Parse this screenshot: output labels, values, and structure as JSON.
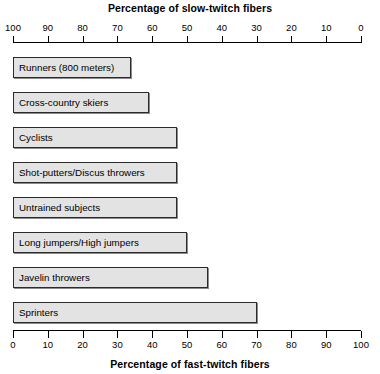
{
  "chart_data": {
    "type": "bar",
    "orientation": "horizontal",
    "title": "",
    "top_axis_title": "Percentage of slow-twitch fibers",
    "bottom_axis_title": "Percentage of fast-twitch fibers",
    "xlabel": "Percentage of fast-twitch fibers",
    "ylabel": "",
    "xlim": [
      0,
      100
    ],
    "grid": false,
    "legend": null,
    "bottom_ticks": [
      "0",
      "10",
      "20",
      "30",
      "40",
      "50",
      "60",
      "70",
      "80",
      "90",
      "100"
    ],
    "top_ticks": [
      "100",
      "90",
      "80",
      "70",
      "60",
      "50",
      "40",
      "30",
      "20",
      "10",
      "0"
    ],
    "bar_fill_color": "#e3e3e3",
    "bar_border_color": "#2b2b2b",
    "categories": [
      "Runners (800 meters)",
      "Cross-country skiers",
      "Cyclists",
      "Shot-putters/Discus throwers",
      "Untrained subjects",
      "Long jumpers/High jumpers",
      "Javelin throwers",
      "Sprinters"
    ],
    "values": [
      34,
      39,
      47,
      47,
      47,
      50,
      56,
      70
    ],
    "series": [
      {
        "name": "Percentage of fast-twitch fibers",
        "values": [
          34,
          39,
          47,
          47,
          47,
          50,
          56,
          70
        ]
      }
    ]
  }
}
